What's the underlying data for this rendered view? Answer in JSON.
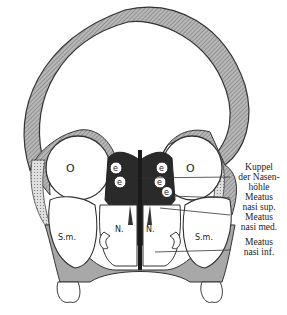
{
  "figure": {
    "region_labels": {
      "orbit_left": "O",
      "orbit_right": "O",
      "ethmoid_cell": "e",
      "nasal_left": "N.",
      "nasal_right": "N.",
      "sinus_left": "S.m.",
      "sinus_right": "S.m."
    },
    "callouts": [
      {
        "id": "kuppel",
        "lines": [
          "Kuppel",
          "der Nasen-",
          "höhle"
        ]
      },
      {
        "id": "meatus_sup",
        "lines": [
          "Meatus",
          "nasi sup."
        ]
      },
      {
        "id": "meatus_med",
        "lines": [
          "Meatus",
          "nasi med."
        ]
      },
      {
        "id": "meatus_inf",
        "lines": [
          "Meatus",
          "nasi inf."
        ]
      }
    ],
    "colors": {
      "bone_fill": "#9a9a9a",
      "dark_mucosa": "#2a2a2a",
      "outline": "#333333",
      "background": "#ffffff"
    }
  }
}
